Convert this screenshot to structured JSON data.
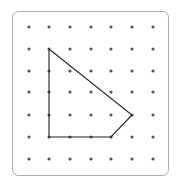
{
  "geoboard": {
    "frame": {
      "x": 12,
      "y": 11,
      "w": 156,
      "h": 164,
      "radius": 6,
      "stroke": "#aaaaaa"
    },
    "grid": {
      "cols": 7,
      "rows": 7,
      "x": [
        29,
        49,
        70,
        91,
        111,
        132,
        153
      ],
      "y": [
        27,
        49,
        71,
        92,
        115,
        137,
        159
      ],
      "dot_color": "#555555",
      "dot_radius": 1.6
    },
    "polygon": {
      "vertices_grid": [
        [
          1,
          1
        ],
        [
          5,
          4
        ],
        [
          4,
          5
        ],
        [
          1,
          5
        ]
      ],
      "stroke": "#222222",
      "stroke_width": 1.1
    }
  }
}
